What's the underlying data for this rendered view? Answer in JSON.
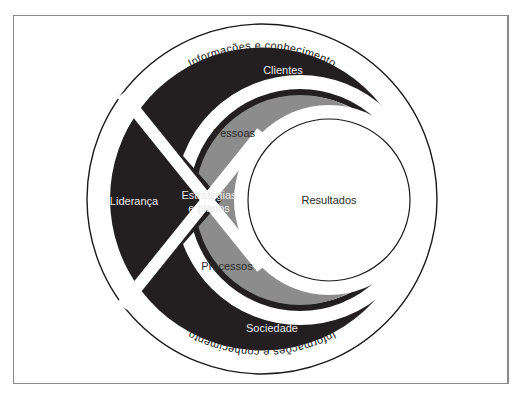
{
  "diagram": {
    "type": "model-diagram",
    "outer_ring_label_top": "Informações e conhecimento",
    "outer_ring_label_bottom": "Informações e conhecimento",
    "segments": {
      "clientes": "Clientes",
      "sociedade": "Sociedade",
      "lideranca": "Liderança",
      "estrategias_line1": "Estratégias",
      "estrategias_line2": "e planos",
      "pessoas": "Pessoas",
      "processos": "Processos",
      "resultados": "Resultados"
    },
    "colors": {
      "dark": "#231f20",
      "gray": "#8c8c8c",
      "background": "#ffffff",
      "stroke": "#1a1a1a"
    }
  }
}
